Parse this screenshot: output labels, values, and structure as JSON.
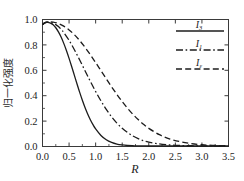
{
  "chart_data": {
    "type": "line",
    "title": "",
    "xlabel": "R",
    "ylabel": "归一化强度",
    "xlim": [
      0.0,
      3.5
    ],
    "ylim": [
      0.0,
      1.0
    ],
    "xticks": [
      "0.0",
      "0.5",
      "1.0",
      "1.5",
      "2.0",
      "2.5",
      "3.0",
      "3.5"
    ],
    "yticks": [
      "0.0",
      "0.2",
      "0.4",
      "0.6",
      "0.8",
      "1.0"
    ],
    "xtick_values": [
      0.0,
      0.5,
      1.0,
      1.5,
      2.0,
      2.5,
      3.0,
      3.5
    ],
    "ytick_values": [
      0.0,
      0.2,
      0.4,
      0.6,
      0.8,
      1.0
    ],
    "grid": false,
    "legend_position": "top-right",
    "series": [
      {
        "name": "I_3",
        "label_base": "I",
        "label_sub": "3",
        "style": "solid",
        "color": "#1c1c1c",
        "x": [
          0.0,
          0.05,
          0.1,
          0.15,
          0.2,
          0.25,
          0.3,
          0.35,
          0.4,
          0.45,
          0.5,
          0.55,
          0.6,
          0.65,
          0.7,
          0.75,
          0.8,
          0.85,
          0.9,
          0.95,
          1.0,
          1.1,
          1.2,
          1.3,
          1.4,
          1.5,
          1.6,
          1.7,
          1.8,
          2.0,
          2.2,
          2.5,
          2.8,
          3.1,
          3.5
        ],
        "y": [
          0.96,
          0.975,
          0.978,
          0.972,
          0.958,
          0.935,
          0.903,
          0.862,
          0.812,
          0.756,
          0.694,
          0.628,
          0.56,
          0.492,
          0.426,
          0.364,
          0.307,
          0.256,
          0.211,
          0.172,
          0.139,
          0.087,
          0.053,
          0.032,
          0.019,
          0.012,
          0.008,
          0.006,
          0.005,
          0.004,
          0.004,
          0.004,
          0.004,
          0.004,
          0.004
        ]
      },
      {
        "name": "I_1",
        "label_base": "I",
        "label_sub": "1",
        "style": "dashdot",
        "color": "#1c1c1c",
        "x": [
          0.0,
          0.05,
          0.1,
          0.15,
          0.2,
          0.25,
          0.3,
          0.35,
          0.4,
          0.5,
          0.6,
          0.7,
          0.8,
          0.9,
          1.0,
          1.1,
          1.2,
          1.3,
          1.4,
          1.5,
          1.6,
          1.7,
          1.8,
          1.9,
          2.0,
          2.2,
          2.4,
          2.6,
          2.8,
          3.0,
          3.2,
          3.5
        ],
        "y": [
          0.96,
          0.976,
          0.98,
          0.978,
          0.971,
          0.96,
          0.944,
          0.923,
          0.898,
          0.836,
          0.762,
          0.681,
          0.597,
          0.513,
          0.433,
          0.359,
          0.292,
          0.234,
          0.184,
          0.143,
          0.11,
          0.083,
          0.062,
          0.046,
          0.035,
          0.02,
          0.012,
          0.008,
          0.006,
          0.005,
          0.004,
          0.004
        ]
      },
      {
        "name": "I_epsilon",
        "label_base": "I",
        "label_sub": "ε",
        "style": "dashed",
        "color": "#1c1c1c",
        "x": [
          0.0,
          0.05,
          0.1,
          0.2,
          0.3,
          0.4,
          0.5,
          0.6,
          0.7,
          0.8,
          0.9,
          1.0,
          1.1,
          1.2,
          1.3,
          1.4,
          1.5,
          1.6,
          1.7,
          1.8,
          1.9,
          2.0,
          2.2,
          2.4,
          2.6,
          2.8,
          3.0,
          3.2,
          3.5
        ],
        "y": [
          0.96,
          0.976,
          0.982,
          0.98,
          0.968,
          0.948,
          0.918,
          0.88,
          0.834,
          0.781,
          0.723,
          0.661,
          0.597,
          0.533,
          0.47,
          0.41,
          0.353,
          0.301,
          0.254,
          0.212,
          0.175,
          0.143,
          0.093,
          0.059,
          0.037,
          0.023,
          0.014,
          0.009,
          0.005
        ]
      }
    ]
  },
  "legend": {
    "items": [
      {
        "base": "I",
        "sub": "3",
        "style": "solid"
      },
      {
        "base": "I",
        "sub": "1",
        "style": "dashdot"
      },
      {
        "base": "I",
        "sub": "ε",
        "style": "dashed"
      }
    ]
  },
  "axes": {
    "x_title": "R",
    "y_title": "归一化强度"
  },
  "colors": {
    "line": "#1c1c1c",
    "frame": "#3a3a3a",
    "background": "#ffffff"
  }
}
